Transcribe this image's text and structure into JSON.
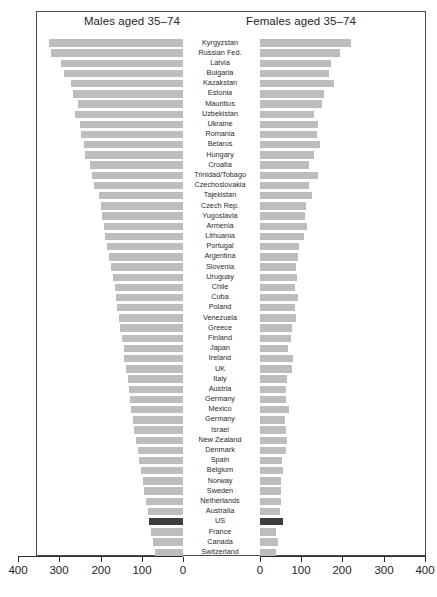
{
  "figure": {
    "panel_left_title": "Males aged 35–74",
    "panel_right_title": "Females aged 35–74",
    "highlight_country": "US",
    "highlight_color": "#3d3d3d",
    "bar_color": "#bdbdbd",
    "frame_color": "#4a4a4a",
    "caption": ""
  },
  "axis": {
    "left_ticks": [
      "400",
      "300",
      "200",
      "100",
      "0"
    ],
    "right_ticks": [
      "0",
      "100",
      "200",
      "300",
      "400"
    ],
    "left_tick_x": [
      18,
      59,
      101,
      142,
      183
    ],
    "right_tick_x": [
      260,
      301,
      342,
      384,
      425
    ],
    "max": 400,
    "px_per_unit": 0.412,
    "left_zero_x": 183,
    "right_zero_x": 260
  },
  "chart_data": {
    "type": "bar",
    "title": "",
    "subtitle": "",
    "orientation": "horizontal",
    "layout": "back-to-back population pyramid (butterfly) chart",
    "xlabel": "",
    "ylabel": "",
    "xlim": [
      0,
      400
    ],
    "grid": false,
    "legend": false,
    "categories": [
      "Kyrgyzstan",
      "Russian Fed.",
      "Latvia",
      "Bulgaria",
      "Kazakstan",
      "Estonia",
      "Mauritius",
      "Uzbekistan",
      "Ukraine",
      "Romania",
      "Belarus",
      "Hungary",
      "Croatia",
      "Trinidad/Tobago",
      "Czechoslovakia",
      "Tajekistan",
      "Czech Rep.",
      "Yugoslavia",
      "Armenia",
      "Lithuania",
      "Portugal",
      "Argentina",
      "Slovenia",
      "Uruguay",
      "Chile",
      "Cuba",
      "Poland",
      "Venezuela",
      "Greece",
      "Finland",
      "Japan",
      "Ireland",
      "UK",
      "Italy",
      "Austria",
      "Germany",
      "Mexico",
      "Germany",
      "Israel",
      "New Zealand",
      "Denmark",
      "Spain",
      "Belgium",
      "Norway",
      "Sweden",
      "Netherlands",
      "Australia",
      "US",
      "France",
      "Canada",
      "Switzerland"
    ],
    "series": [
      {
        "name": "Males aged 35–74",
        "panel": "left",
        "direction": "right-to-left",
        "values": [
          325,
          320,
          295,
          290,
          272,
          268,
          255,
          262,
          250,
          248,
          240,
          238,
          225,
          222,
          215,
          205,
          200,
          196,
          192,
          190,
          185,
          180,
          175,
          170,
          166,
          162,
          160,
          156,
          152,
          148,
          144,
          142,
          138,
          134,
          130,
          128,
          126,
          122,
          118,
          114,
          110,
          106,
          102,
          98,
          94,
          90,
          86,
          82,
          78,
          72,
          68
        ]
      },
      {
        "name": "Females aged 35–74",
        "panel": "right",
        "direction": "left-to-right",
        "values": [
          220,
          195,
          172,
          168,
          180,
          155,
          150,
          130,
          140,
          138,
          145,
          132,
          120,
          140,
          118,
          125,
          112,
          110,
          115,
          108,
          95,
          92,
          88,
          90,
          85,
          92,
          86,
          88,
          78,
          75,
          68,
          80,
          78,
          66,
          64,
          62,
          70,
          60,
          62,
          66,
          64,
          54,
          56,
          52,
          50,
          52,
          48,
          56,
          40,
          44,
          38
        ]
      }
    ]
  }
}
